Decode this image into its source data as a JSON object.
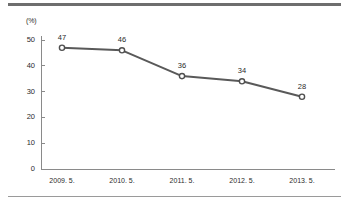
{
  "chart_data": {
    "type": "line",
    "title": "",
    "xlabel": "",
    "ylabel": "",
    "unit_label": "(%)",
    "categories": [
      "2009. 5.",
      "2010. 5.",
      "2011. 5.",
      "2012. 5.",
      "2013. 5."
    ],
    "values": [
      47,
      46,
      36,
      34,
      28
    ],
    "point_labels": [
      "47",
      "46",
      "36",
      "34",
      "28"
    ],
    "ylim": [
      0,
      50
    ],
    "yticks": [
      0,
      10,
      20,
      30,
      40,
      50
    ],
    "ytick_labels": [
      "0",
      "10",
      "20",
      "30",
      "40",
      "50"
    ],
    "grid": false,
    "legend": false,
    "legend_position": "none",
    "series": [
      {
        "name": "",
        "values": [
          47,
          46,
          36,
          34,
          28
        ]
      }
    ],
    "colors": {
      "line": "#595959",
      "marker_stroke": "#4f4f4f",
      "marker_fill": "#ffffff",
      "axis": "#8a8a8a",
      "text": "#2b2b2b",
      "rule_top": "#6e6e6e",
      "rule_bottom": "#9a9a9a",
      "background": "#ffffff"
    }
  }
}
